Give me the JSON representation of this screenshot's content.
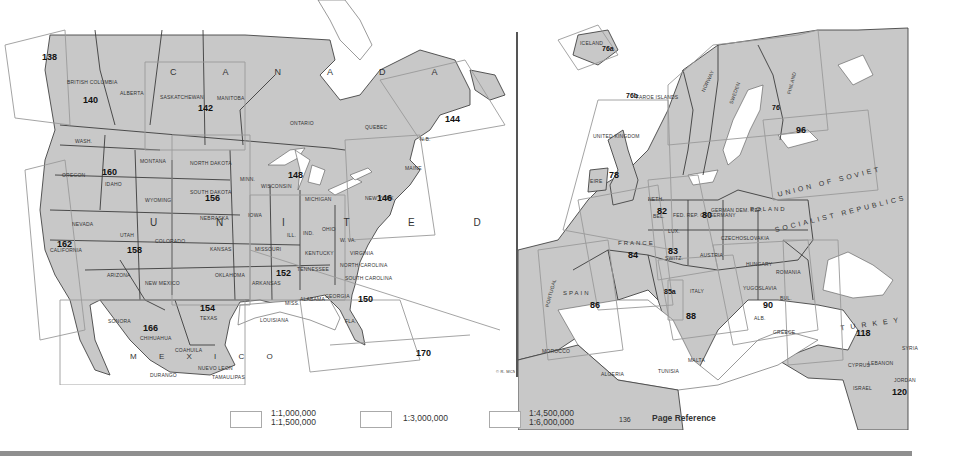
{
  "north_america": {
    "countries": {
      "canada": "C A N A D A",
      "united_states": "U N I T E D   S T A T E S",
      "mexico": "M E X I C O"
    },
    "regions": [
      "British Columbia",
      "Alberta",
      "Saskatchewan",
      "Manitoba",
      "Ontario",
      "Quebec",
      "Wash.",
      "Oregon",
      "Idaho",
      "Montana",
      "Wyoming",
      "North Dakota",
      "South Dakota",
      "Minn.",
      "Wisconsin",
      "Michigan",
      "Nebraska",
      "Iowa",
      "Nevada",
      "California",
      "Utah",
      "Colorado",
      "Kansas",
      "Missouri",
      "Ill.",
      "Ind.",
      "Ohio",
      "Kentucky",
      "W. Va.",
      "Virginia",
      "Arizona",
      "New Mexico",
      "Oklahoma",
      "Arkansas",
      "Tennessee",
      "North Carolina",
      "South Carolina",
      "Miss.",
      "Alabama",
      "Georgia",
      "Louisiana",
      "Texas",
      "Fla.",
      "New York",
      "Maine",
      "N.B.",
      "Sonora",
      "Chihuahua",
      "Coahuila",
      "Durango",
      "Nuevo Leon",
      "Tamaulipas",
      "Baja Cal. Norte",
      "Baja Cal. Sur"
    ],
    "page_refs": [
      "138",
      "140",
      "142",
      "144",
      "146",
      "148",
      "150",
      "152",
      "154",
      "156",
      "158",
      "160",
      "162",
      "166",
      "170"
    ]
  },
  "europe": {
    "countries": [
      "Iceland",
      "Faroe Islands",
      "United Kingdom",
      "Eire",
      "Norway",
      "Sweden",
      "Finland",
      "Union of Soviet Socialist Republics",
      "Poland",
      "German Dem. Rep.",
      "Fed. Rep. of Germany",
      "Neth.",
      "Bel.",
      "Lux.",
      "France",
      "Switz.",
      "Austria",
      "Czechoslovakia",
      "Hungary",
      "Romania",
      "Yugoslavia",
      "Bul.",
      "Alb.",
      "Greece",
      "Spain",
      "Portugal",
      "Italy",
      "Turkey",
      "Syria",
      "Cyprus",
      "Lebanon",
      "Israel",
      "Jordan",
      "Morocco",
      "Algeria",
      "Tunisia",
      "Malta"
    ],
    "ussr_label_1": "UNION OF SOVIET",
    "ussr_label_2": "SOCIALIST REPUBLICS",
    "page_refs": [
      "76a",
      "76b",
      "76",
      "78",
      "80",
      "82",
      "83",
      "84",
      "85a",
      "86",
      "88",
      "90",
      "96",
      "118",
      "120"
    ]
  },
  "legend": {
    "items": [
      {
        "label": "1:1,000,000\n1:1,500,000"
      },
      {
        "label": "1:3,000,000"
      },
      {
        "label": "1:4,500,000\n1:6,000,000"
      }
    ],
    "page_ref_sample": "136",
    "page_ref_label": "Page Reference"
  },
  "credit": "© R. MCN."
}
